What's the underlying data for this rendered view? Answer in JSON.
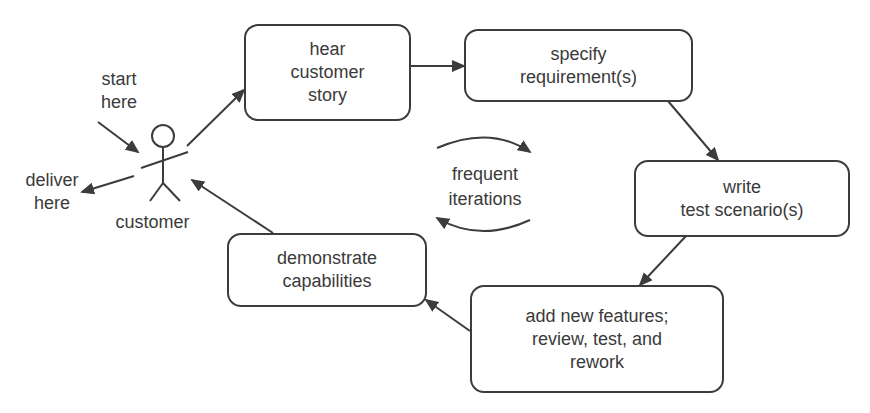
{
  "diagram": {
    "title": "",
    "actor": {
      "label": "customer"
    },
    "annotations": {
      "start": [
        "start",
        "here"
      ],
      "deliver": [
        "deliver",
        "here"
      ],
      "center": [
        "frequent",
        "iterations"
      ]
    },
    "steps": [
      {
        "id": "hear",
        "lines": [
          "hear",
          "customer",
          "story"
        ]
      },
      {
        "id": "specify",
        "lines": [
          "specify",
          "requirement(s)"
        ]
      },
      {
        "id": "write",
        "lines": [
          "write",
          "test scenario(s)"
        ]
      },
      {
        "id": "add",
        "lines": [
          "add new features;",
          "review, test, and",
          "rework"
        ]
      },
      {
        "id": "demonstrate",
        "lines": [
          "demonstrate",
          "capabilities"
        ]
      }
    ],
    "flow": [
      {
        "from": "customer",
        "to": "hear"
      },
      {
        "from": "hear",
        "to": "specify"
      },
      {
        "from": "specify",
        "to": "write"
      },
      {
        "from": "write",
        "to": "add"
      },
      {
        "from": "add",
        "to": "demonstrate"
      },
      {
        "from": "demonstrate",
        "to": "customer"
      }
    ],
    "colors": {
      "stroke": "#3c3c3c",
      "text": "#3a3a3a",
      "background": "#ffffff"
    }
  }
}
